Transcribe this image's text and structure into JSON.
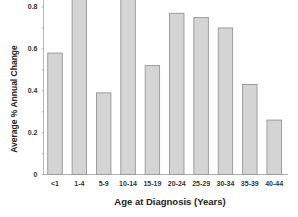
{
  "chart_data": {
    "type": "bar",
    "title": "",
    "xlabel": "Age at Diagnosis (Years)",
    "ylabel": "Average % Annual Change",
    "categories": [
      "<1",
      "1-4",
      "5-9",
      "10-14",
      "15-19",
      "20-24",
      "25-29",
      "30-34",
      "35-39",
      "40-44"
    ],
    "values": [
      0.58,
      0.87,
      0.39,
      0.89,
      0.52,
      0.77,
      0.75,
      0.7,
      0.43,
      0.26
    ],
    "ylim": [
      0,
      0.9
    ],
    "yticks": [
      0,
      0.2,
      0.4,
      0.6,
      0.8
    ],
    "ytick_labels": [
      "0",
      "0.2",
      "0.4",
      "0.6",
      "0.8"
    ],
    "minor_ytick_step": 0.1,
    "grid": false,
    "legend": null
  },
  "colors": {
    "bar_fill": "#d4d4d4",
    "bar_stroke": "#8c8c8c",
    "axis": "#999999",
    "text": "#222222"
  }
}
